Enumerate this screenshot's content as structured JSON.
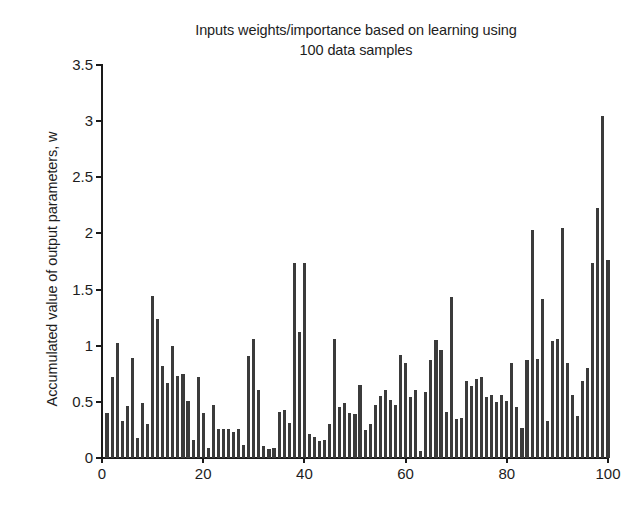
{
  "chart_data": {
    "type": "bar",
    "title": "Inputs weights/importance based on learning using\n100 data samples",
    "xlabel": "",
    "ylabel": "Accumulated value of output parameters, w",
    "xlim": [
      0,
      100
    ],
    "ylim": [
      0,
      3.5
    ],
    "grid": false,
    "legend": null,
    "bar_color": "#3b3b3b",
    "axis_color": "#1a1a1a",
    "background": "#ffffff",
    "ytick_labels": [
      "0",
      "0.5",
      "1",
      "1.5",
      "2",
      "2.5",
      "3",
      "3.5"
    ],
    "ytick_values": [
      0,
      0.5,
      1,
      1.5,
      2,
      2.5,
      3,
      3.5
    ],
    "xtick_labels": [
      "0",
      "20",
      "40",
      "60",
      "80",
      "100"
    ],
    "xtick_values": [
      0,
      20,
      40,
      60,
      80,
      100
    ],
    "categories": [
      1,
      2,
      3,
      4,
      5,
      6,
      7,
      8,
      9,
      10,
      11,
      12,
      13,
      14,
      15,
      16,
      17,
      18,
      19,
      20,
      21,
      22,
      23,
      24,
      25,
      26,
      27,
      28,
      29,
      30,
      31,
      32,
      33,
      34,
      35,
      36,
      37,
      38,
      39,
      40,
      41,
      42,
      43,
      44,
      45,
      46,
      47,
      48,
      49,
      50,
      51,
      52,
      53,
      54,
      55,
      56,
      57,
      58,
      59,
      60,
      61,
      62,
      63,
      64,
      65,
      66,
      67,
      68,
      69,
      70,
      71,
      72,
      73,
      74,
      75,
      76,
      77,
      78,
      79,
      80,
      81,
      82,
      83,
      84,
      85,
      86,
      87,
      88,
      89,
      90,
      91,
      92,
      93,
      94,
      95,
      96,
      97,
      98,
      99,
      100
    ],
    "values": [
      0.4,
      0.72,
      1.02,
      0.33,
      0.46,
      0.89,
      0.18,
      0.49,
      0.3,
      1.44,
      1.24,
      0.82,
      0.67,
      1.0,
      0.73,
      0.75,
      0.51,
      0.16,
      0.72,
      0.4,
      0.09,
      0.47,
      0.26,
      0.26,
      0.26,
      0.23,
      0.26,
      0.12,
      0.91,
      1.06,
      0.61,
      0.11,
      0.08,
      0.09,
      0.41,
      0.43,
      0.31,
      1.74,
      1.12,
      1.74,
      0.21,
      0.19,
      0.15,
      0.16,
      0.3,
      1.06,
      0.45,
      0.49,
      0.4,
      0.39,
      0.65,
      0.25,
      0.3,
      0.47,
      0.55,
      0.61,
      0.52,
      0.47,
      0.92,
      0.85,
      0.54,
      0.61,
      0.06,
      0.59,
      0.87,
      1.05,
      0.96,
      0.41,
      1.43,
      0.35,
      0.36,
      0.69,
      0.64,
      0.7,
      0.72,
      0.54,
      0.56,
      0.5,
      0.56,
      0.51,
      0.85,
      0.45,
      0.27,
      0.87,
      2.03,
      0.88,
      1.42,
      0.33,
      1.04,
      1.06,
      2.05,
      0.85,
      0.56,
      0.37,
      0.69,
      0.8,
      1.74,
      2.23,
      3.05,
      1.76
    ]
  }
}
